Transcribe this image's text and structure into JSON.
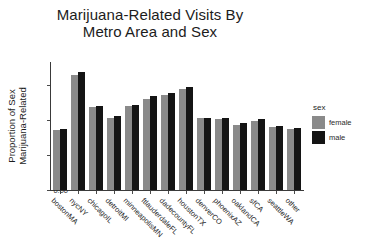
{
  "chart_data": {
    "type": "bar",
    "title": "Marijuana-Related Visits By\nMetro Area and Sex",
    "title_line1": "Marijuana-Related Visits By",
    "title_line2": "Metro Area and Sex",
    "xlabel": "",
    "ylabel": "Proportion of Sex\nMarijuana-Related",
    "ylabel_line1": "Proportion of Sex",
    "ylabel_line2": "Marijuana-Related",
    "ylim": [
      0,
      0.1095
    ],
    "yticks": [
      "0.00",
      "0.03",
      "0.06",
      "0.09"
    ],
    "ytick_values": [
      0.0,
      0.03,
      0.06,
      0.09
    ],
    "grid": false,
    "legend_position": "right",
    "legend_title": "sex",
    "categories": [
      "bostonMA",
      "nycNY",
      "chicagoIL",
      "detroitMI",
      "minneapolisMN",
      "ftlauderdaleFL",
      "dadecountyFL",
      "houstonTX",
      "denverCO",
      "phoenixAZ",
      "oaklandCA",
      "sfCA",
      "seattleWA",
      "other"
    ],
    "series": [
      {
        "name": "female",
        "color": "#8a8a8a",
        "values": [
          0.051,
          0.098,
          0.071,
          0.062,
          0.072,
          0.078,
          0.081,
          0.086,
          0.062,
          0.061,
          0.056,
          0.059,
          0.054,
          0.052
        ]
      },
      {
        "name": "male",
        "color": "#141414",
        "values": [
          0.052,
          0.101,
          0.072,
          0.063,
          0.073,
          0.08,
          0.083,
          0.088,
          0.062,
          0.062,
          0.057,
          0.061,
          0.055,
          0.053
        ]
      }
    ]
  }
}
